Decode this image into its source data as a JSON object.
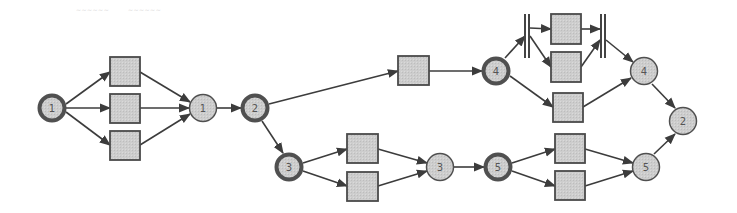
{
  "diagram": {
    "type": "petri-net-workflow",
    "faint_labels": [
      {
        "id": "fl1",
        "text": "~~~~~~",
        "x": 76
      },
      {
        "id": "fl2",
        "text": "~~~~~~",
        "x": 128
      }
    ],
    "colors": {
      "node_fill": "#d2d2d2",
      "node_stroke": "#505050",
      "box_fill": "#c9c9c9",
      "box_stroke": "#4a4a4a",
      "edge": "#3c3c3c",
      "label": "#555555"
    },
    "places": [
      {
        "id": "p-start-1",
        "label": "1",
        "cx": 52,
        "cy": 108,
        "bold": true
      },
      {
        "id": "p-join-1",
        "label": "1",
        "cx": 203,
        "cy": 108,
        "bold": false
      },
      {
        "id": "p-split-2",
        "label": "2",
        "cx": 255,
        "cy": 108,
        "bold": true
      },
      {
        "id": "p-split-3",
        "label": "3",
        "cx": 289,
        "cy": 167,
        "bold": true
      },
      {
        "id": "p-join-3",
        "label": "3",
        "cx": 440,
        "cy": 167,
        "bold": false
      },
      {
        "id": "p-split-4",
        "label": "4",
        "cx": 496,
        "cy": 71,
        "bold": true
      },
      {
        "id": "p-split-5",
        "label": "5",
        "cx": 498,
        "cy": 167,
        "bold": true
      },
      {
        "id": "p-join-4",
        "label": "4",
        "cx": 644,
        "cy": 71,
        "bold": false
      },
      {
        "id": "p-join-5",
        "label": "5",
        "cx": 646,
        "cy": 167,
        "bold": false
      },
      {
        "id": "p-end-2",
        "label": "2",
        "cx": 683,
        "cy": 121,
        "bold": false
      }
    ],
    "transitions": [
      {
        "id": "t1a",
        "x": 110,
        "y": 57,
        "w": 30,
        "h": 29
      },
      {
        "id": "t1b",
        "x": 110,
        "y": 94,
        "w": 30,
        "h": 29
      },
      {
        "id": "t1c",
        "x": 110,
        "y": 131,
        "w": 30,
        "h": 29
      },
      {
        "id": "t4",
        "x": 398,
        "y": 56,
        "w": 31,
        "h": 29
      },
      {
        "id": "t3a",
        "x": 347,
        "y": 134,
        "w": 31,
        "h": 29
      },
      {
        "id": "t3b",
        "x": 347,
        "y": 172,
        "w": 31,
        "h": 29
      },
      {
        "id": "tpa",
        "x": 551,
        "y": 14,
        "w": 30,
        "h": 30
      },
      {
        "id": "tpb",
        "x": 551,
        "y": 52,
        "w": 30,
        "h": 30
      },
      {
        "id": "t4c",
        "x": 553,
        "y": 93,
        "w": 30,
        "h": 29
      },
      {
        "id": "t5a",
        "x": 555,
        "y": 134,
        "w": 30,
        "h": 29
      },
      {
        "id": "t5b",
        "x": 555,
        "y": 171,
        "w": 30,
        "h": 29
      }
    ],
    "bars": [
      {
        "id": "fork-bar",
        "x": 524,
        "y": 14,
        "h": 44
      },
      {
        "id": "join-bar",
        "x": 600,
        "y": 14,
        "h": 44
      }
    ],
    "edges": [
      [
        66,
        104,
        110,
        72
      ],
      [
        66,
        108,
        110,
        108
      ],
      [
        66,
        112,
        110,
        145
      ],
      [
        140,
        72,
        190,
        102
      ],
      [
        140,
        108,
        189,
        108
      ],
      [
        140,
        145,
        190,
        114
      ],
      [
        217,
        108,
        241,
        108
      ],
      [
        269,
        104,
        398,
        71
      ],
      [
        262,
        121,
        283,
        153
      ],
      [
        303,
        163,
        347,
        149
      ],
      [
        303,
        171,
        347,
        186
      ],
      [
        378,
        149,
        427,
        163
      ],
      [
        378,
        186,
        427,
        171
      ],
      [
        429,
        71,
        482,
        71
      ],
      [
        454,
        167,
        484,
        167
      ],
      [
        505,
        58,
        525,
        36
      ],
      [
        510,
        76,
        553,
        107
      ],
      [
        530,
        28,
        551,
        29
      ],
      [
        530,
        36,
        551,
        67
      ],
      [
        581,
        29,
        600,
        29
      ],
      [
        581,
        67,
        600,
        40
      ],
      [
        606,
        40,
        633,
        62
      ],
      [
        583,
        107,
        631,
        78
      ],
      [
        512,
        163,
        555,
        149
      ],
      [
        512,
        171,
        555,
        186
      ],
      [
        585,
        149,
        633,
        163
      ],
      [
        585,
        186,
        633,
        171
      ],
      [
        652,
        84,
        675,
        108
      ],
      [
        654,
        154,
        675,
        134
      ]
    ]
  }
}
